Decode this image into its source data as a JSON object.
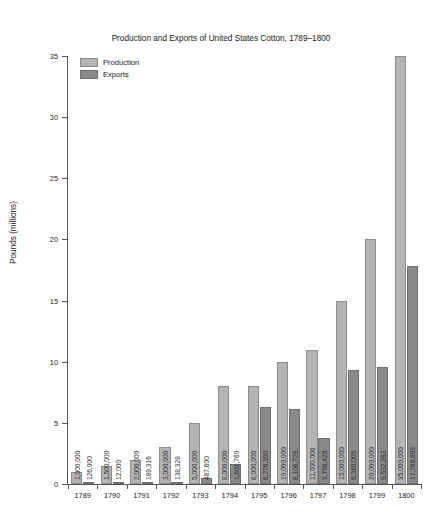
{
  "chart_data": {
    "type": "bar",
    "title": "Production and Exports of United States Cotton, 1789–1800",
    "xlabel": "",
    "ylabel": "Pounds (millions)",
    "ylim": [
      0,
      35
    ],
    "yticks": [
      0,
      5,
      10,
      15,
      20,
      25,
      30,
      35
    ],
    "ytick_labels": [
      "0",
      "5",
      "10",
      "15",
      "20",
      "25",
      "30",
      "35"
    ],
    "grid": false,
    "legend_position": "upper left",
    "value_label_unit": "pounds",
    "value_labels_rotation": "vertical",
    "categories": [
      "1789",
      "1790",
      "1791",
      "1792",
      "1793",
      "1794",
      "1795",
      "1796",
      "1797",
      "1798",
      "1799",
      "1800"
    ],
    "series": [
      {
        "name": "Production",
        "color": "#b4b4b4",
        "values": [
          1000000,
          1500000,
          2000000,
          3000000,
          5000000,
          8000000,
          8000000,
          10000000,
          11000000,
          15000000,
          20000000,
          35000000
        ],
        "value_labels": [
          "1,000,000",
          "1,500,000",
          "2,000,000",
          "3,000,000",
          "5,000,000",
          "8,000,000",
          "8,000,000",
          "10,000,000",
          "11,000,000",
          "15,000,000",
          "20,000,000",
          "35,000,000"
        ]
      },
      {
        "name": "Exports",
        "color": "#8a8a8a",
        "values": [
          126000,
          12000,
          189316,
          138328,
          487600,
          1601760,
          6276300,
          6106729,
          3788429,
          9360005,
          9532263,
          17789803
        ],
        "value_labels": [
          "126,000",
          "12,000",
          "189,316",
          "138,328",
          "487,600",
          "1,601,760",
          "6,276,300",
          "6,106,729",
          "3,788,429",
          "9,360,005",
          "9,532,263",
          "17,789,803"
        ]
      }
    ]
  }
}
